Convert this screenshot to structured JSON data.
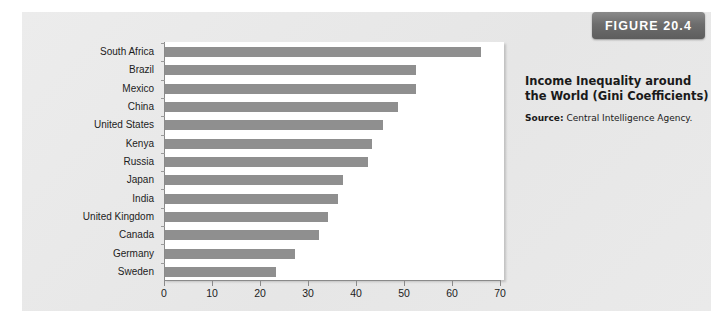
{
  "figure": {
    "badge_label": "FIGURE 20.4",
    "caption_title": "Income Inequality around the World (Gini Coefficients)",
    "source_label": "Source:",
    "source_text": " Central Intelligence Agency."
  },
  "colors": {
    "panel_bg": "#e9e9e9",
    "plot_bg": "#ffffff",
    "bar": "#8f8f8f",
    "axis": "#8a8a8a",
    "badge_bg": "#6e6e6e",
    "badge_text": "#ffffff",
    "text": "#1c1c1c"
  },
  "chart_data": {
    "type": "bar",
    "orientation": "horizontal",
    "title": "Income Inequality around the World (Gini Coefficients)",
    "xlabel": "",
    "ylabel": "",
    "xlim": [
      0,
      70
    ],
    "xticks": [
      0,
      10,
      20,
      30,
      40,
      50,
      60,
      70
    ],
    "xtick_labels": [
      "0",
      "10",
      "20",
      "30",
      "40",
      "50",
      "60",
      "70"
    ],
    "grid": false,
    "legend": false,
    "categories": [
      "South Africa",
      "Brazil",
      "Mexico",
      "China",
      "United States",
      "Kenya",
      "Russia",
      "Japan",
      "India",
      "United Kingdom",
      "Canada",
      "Germany",
      "Sweden"
    ],
    "values": [
      65.8,
      52.3,
      52.3,
      48.5,
      45.4,
      43.1,
      42.3,
      37.1,
      36.0,
      34.0,
      32.1,
      27.1,
      23.1
    ],
    "source": "Central Intelligence Agency."
  }
}
